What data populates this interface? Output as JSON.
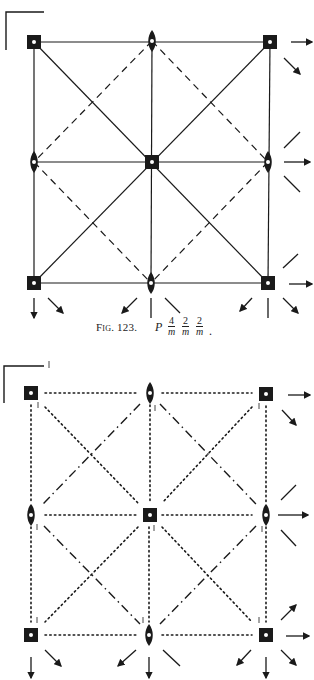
{
  "figures": [
    {
      "id": "top",
      "description": "Symmetry elements diagram, full-line mirrors with dashed glide lines",
      "grid_points": {
        "rows": [
          [
            [
              34,
              42
            ],
            [
              152,
              41
            ],
            [
              270,
              42
            ]
          ],
          [
            [
              34,
              162
            ],
            [
              152,
              162
            ],
            [
              268,
              162
            ]
          ],
          [
            [
              34,
              283
            ],
            [
              151,
              283
            ],
            [
              268,
              283
            ]
          ]
        ]
      },
      "corner_symbol": "4-fold axis with inversion (filled square, white dot)",
      "edge_symbol": "2-fold axis (filled lens, white dot)",
      "mirror_style": "solid",
      "glide_style": "dashed"
    },
    {
      "id": "bottom",
      "description": "Symmetry elements diagram, dotted mirror traces and dash-dot glide lines",
      "grid_points": {
        "rows": [
          [
            [
              31,
              393
            ],
            [
              150,
              393
            ],
            [
              266,
              394
            ]
          ],
          [
            [
              31,
              515
            ],
            [
              150,
              515
            ],
            [
              266,
              515
            ]
          ],
          [
            [
              31,
              635
            ],
            [
              149,
              635
            ],
            [
              266,
              635
            ]
          ]
        ]
      },
      "corner_symbol": "4-fold axis with inversion (filled square, white dot)",
      "edge_symbol": "2-fold axis (filled lens, white dot)",
      "mirror_style": "dotted",
      "glide_style": "dash-dot"
    }
  ],
  "caption": {
    "label": "Fig. 123.",
    "lattice": "P",
    "fractions": [
      {
        "num": "4",
        "den": "m"
      },
      {
        "num": "2",
        "den": "m"
      },
      {
        "num": "2",
        "den": "m"
      }
    ],
    "trailing": "."
  },
  "colors": {
    "ink": "#1a1a1a",
    "background": "#ffffff"
  }
}
